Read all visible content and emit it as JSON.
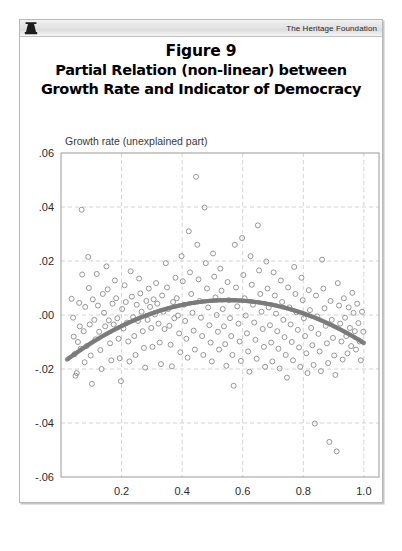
{
  "header": {
    "logo_icon": "liberty-bell-icon",
    "brand": "The Heritage Foundation"
  },
  "title": {
    "line1": "Figure 9",
    "line2": "Partial Relation (non-linear) between",
    "line3": "Growth Rate and Indicator of Democracy"
  },
  "colors": {
    "marker_stroke": "#8c8c8c",
    "curve": "#7a7a7a",
    "gridline": "#c9c9c9",
    "plot_border": "#9a9a9a",
    "text": "#2b2b2b",
    "frame": "#b9b9b9"
  },
  "chart_data": {
    "type": "scatter",
    "title": "Partial Relation (non-linear) between Growth Rate and Indicator of Democracy",
    "xlabel": "Democracy indicator",
    "ylabel": "Growth rate (unexplained part)",
    "xlim": [
      0.0,
      1.05
    ],
    "ylim": [
      -0.06,
      0.06
    ],
    "xticks": [
      0.2,
      0.4,
      0.6,
      0.8,
      1.0
    ],
    "xtick_labels": [
      "0.2",
      "0.4",
      "0.6",
      "0.8",
      "1.0"
    ],
    "yticks": [
      0.06,
      0.04,
      0.02,
      0.0,
      -0.02,
      -0.04,
      -0.06
    ],
    "ytick_labels": [
      ".06",
      ".04",
      ".02",
      ".00",
      "-.02",
      "-.04",
      "-.06"
    ],
    "grid": true,
    "grid_style": "dashed",
    "legend": null,
    "marker": "open-circle",
    "series": [
      {
        "name": "Countries",
        "marker": "open-circle",
        "points": [
          [
            0.035,
            0.006
          ],
          [
            0.04,
            -0.001
          ],
          [
            0.042,
            -0.008
          ],
          [
            0.045,
            -0.0145
          ],
          [
            0.048,
            -0.0225
          ],
          [
            0.052,
            -0.0215
          ],
          [
            0.056,
            -0.01
          ],
          [
            0.06,
            0.0045
          ],
          [
            0.062,
            -0.0042
          ],
          [
            0.065,
            -0.0125
          ],
          [
            0.068,
            0.039
          ],
          [
            0.07,
            0.015
          ],
          [
            0.075,
            -0.006
          ],
          [
            0.078,
            -0.0175
          ],
          [
            0.08,
            0.003
          ],
          [
            0.085,
            -0.0115
          ],
          [
            0.09,
            0.0215
          ],
          [
            0.092,
            0.01
          ],
          [
            0.095,
            -0.0035
          ],
          [
            0.098,
            -0.015
          ],
          [
            0.102,
            -0.0255
          ],
          [
            0.105,
            0.0058
          ],
          [
            0.11,
            -0.0018
          ],
          [
            0.114,
            -0.009
          ],
          [
            0.118,
            0.0152
          ],
          [
            0.122,
            0.0035
          ],
          [
            0.126,
            -0.0062
          ],
          [
            0.13,
            -0.013
          ],
          [
            0.134,
            -0.02
          ],
          [
            0.138,
            0.0078
          ],
          [
            0.142,
            0.0008
          ],
          [
            0.146,
            -0.0042
          ],
          [
            0.15,
            0.018
          ],
          [
            0.154,
            0.0095
          ],
          [
            0.158,
            -0.002
          ],
          [
            0.162,
            -0.0105
          ],
          [
            0.166,
            -0.0168
          ],
          [
            0.17,
            0.0042
          ],
          [
            0.174,
            -0.0035
          ],
          [
            0.178,
            0.0128
          ],
          [
            0.182,
            0.0062
          ],
          [
            0.186,
            -0.0012
          ],
          [
            0.19,
            -0.0088
          ],
          [
            0.194,
            -0.016
          ],
          [
            0.198,
            -0.0245
          ],
          [
            0.202,
            0.0022
          ],
          [
            0.206,
            -0.005
          ],
          [
            0.21,
            0.011
          ],
          [
            0.214,
            0.0048
          ],
          [
            0.218,
            -0.0028
          ],
          [
            0.222,
            -0.0098
          ],
          [
            0.226,
            -0.0172
          ],
          [
            0.23,
            0.0162
          ],
          [
            0.234,
            0.0068
          ],
          [
            0.238,
            -0.0008
          ],
          [
            0.242,
            -0.0078
          ],
          [
            0.246,
            -0.0148
          ],
          [
            0.25,
            0.0038
          ],
          [
            0.254,
            -0.0022
          ],
          [
            0.258,
            0.0135
          ],
          [
            0.262,
            0.008
          ],
          [
            0.266,
            0.0012
          ],
          [
            0.27,
            -0.006
          ],
          [
            0.274,
            -0.0122
          ],
          [
            0.278,
            -0.0195
          ],
          [
            0.282,
            0.0052
          ],
          [
            0.286,
            -0.0018
          ],
          [
            0.29,
            0.0098
          ],
          [
            0.294,
            0.003
          ],
          [
            0.298,
            -0.0048
          ],
          [
            0.302,
            -0.0118
          ],
          [
            0.306,
            0.0058
          ],
          [
            0.31,
            0.0002
          ],
          [
            0.314,
            0.0118
          ],
          [
            0.318,
            0.0042
          ],
          [
            0.322,
            -0.0032
          ],
          [
            0.326,
            -0.0102
          ],
          [
            0.33,
            -0.0182
          ],
          [
            0.334,
            0.0072
          ],
          [
            0.338,
            0.0012
          ],
          [
            0.342,
            -0.0052
          ],
          [
            0.346,
            0.0192
          ],
          [
            0.35,
            0.0102
          ],
          [
            0.354,
            0.0022
          ],
          [
            0.358,
            -0.004
          ],
          [
            0.362,
            -0.011
          ],
          [
            0.366,
            -0.019
          ],
          [
            0.37,
            0.0048
          ],
          [
            0.374,
            -0.0012
          ],
          [
            0.378,
            0.0138
          ],
          [
            0.382,
            0.0062
          ],
          [
            0.386,
            -0.0002
          ],
          [
            0.39,
            -0.0068
          ],
          [
            0.394,
            -0.0138
          ],
          [
            0.398,
            0.0218
          ],
          [
            0.402,
            0.0125
          ],
          [
            0.406,
            0.0038
          ],
          [
            0.41,
            -0.0022
          ],
          [
            0.414,
            -0.0088
          ],
          [
            0.418,
            -0.0158
          ],
          [
            0.422,
            0.031
          ],
          [
            0.426,
            0.0158
          ],
          [
            0.43,
            0.0078
          ],
          [
            0.434,
            0.0008
          ],
          [
            0.438,
            -0.0058
          ],
          [
            0.442,
            -0.0128
          ],
          [
            0.446,
            0.0512
          ],
          [
            0.45,
            0.026
          ],
          [
            0.454,
            0.0132
          ],
          [
            0.458,
            0.0052
          ],
          [
            0.462,
            -0.001
          ],
          [
            0.466,
            -0.0078
          ],
          [
            0.47,
            -0.0148
          ],
          [
            0.474,
            0.0398
          ],
          [
            0.478,
            0.0192
          ],
          [
            0.482,
            0.0098
          ],
          [
            0.486,
            0.0028
          ],
          [
            0.49,
            -0.0038
          ],
          [
            0.494,
            -0.0102
          ],
          [
            0.498,
            -0.0172
          ],
          [
            0.502,
            0.0228
          ],
          [
            0.506,
            0.0142
          ],
          [
            0.51,
            0.0065
          ],
          [
            0.514,
            0.0
          ],
          [
            0.518,
            -0.0062
          ],
          [
            0.522,
            -0.0128
          ],
          [
            0.526,
            0.0172
          ],
          [
            0.53,
            0.009
          ],
          [
            0.534,
            0.0022
          ],
          [
            0.538,
            -0.0042
          ],
          [
            0.542,
            -0.0108
          ],
          [
            0.546,
            -0.0188
          ],
          [
            0.55,
            0.0122
          ],
          [
            0.554,
            0.0055
          ],
          [
            0.558,
            -0.0012
          ],
          [
            0.562,
            -0.0078
          ],
          [
            0.566,
            -0.0148
          ],
          [
            0.57,
            -0.0262
          ],
          [
            0.574,
            0.026
          ],
          [
            0.578,
            0.0102
          ],
          [
            0.582,
            0.0032
          ],
          [
            0.586,
            -0.0032
          ],
          [
            0.59,
            -0.0098
          ],
          [
            0.594,
            -0.017
          ],
          [
            0.598,
            0.0285
          ],
          [
            0.602,
            0.0148
          ],
          [
            0.606,
            0.0062
          ],
          [
            0.61,
            -0.0002
          ],
          [
            0.614,
            -0.0068
          ],
          [
            0.618,
            -0.0135
          ],
          [
            0.622,
            -0.021
          ],
          [
            0.626,
            0.0218
          ],
          [
            0.63,
            0.0112
          ],
          [
            0.634,
            0.0038
          ],
          [
            0.638,
            -0.0028
          ],
          [
            0.642,
            -0.0092
          ],
          [
            0.646,
            -0.0162
          ],
          [
            0.65,
            0.0332
          ],
          [
            0.654,
            0.0165
          ],
          [
            0.658,
            0.0078
          ],
          [
            0.662,
            0.0012
          ],
          [
            0.666,
            -0.0052
          ],
          [
            0.67,
            -0.0118
          ],
          [
            0.674,
            -0.0192
          ],
          [
            0.678,
            0.0198
          ],
          [
            0.682,
            0.0098
          ],
          [
            0.686,
            0.0028
          ],
          [
            0.69,
            -0.0038
          ],
          [
            0.694,
            -0.0102
          ],
          [
            0.698,
            -0.0172
          ],
          [
            0.702,
            0.0158
          ],
          [
            0.706,
            0.0072
          ],
          [
            0.71,
            0.0005
          ],
          [
            0.714,
            -0.006
          ],
          [
            0.718,
            -0.0125
          ],
          [
            0.722,
            -0.0198
          ],
          [
            0.726,
            0.0128
          ],
          [
            0.73,
            0.0048
          ],
          [
            0.734,
            -0.0018
          ],
          [
            0.738,
            -0.0082
          ],
          [
            0.742,
            -0.0148
          ],
          [
            0.746,
            -0.0232
          ],
          [
            0.75,
            0.0102
          ],
          [
            0.754,
            0.0028
          ],
          [
            0.758,
            -0.0035
          ],
          [
            0.762,
            -0.01
          ],
          [
            0.766,
            -0.0168
          ],
          [
            0.77,
            0.0178
          ],
          [
            0.774,
            0.0078
          ],
          [
            0.778,
            0.001
          ],
          [
            0.782,
            -0.0055
          ],
          [
            0.786,
            -0.012
          ],
          [
            0.79,
            -0.0192
          ],
          [
            0.794,
            0.0138
          ],
          [
            0.798,
            0.0055
          ],
          [
            0.802,
            -0.0012
          ],
          [
            0.806,
            -0.0078
          ],
          [
            0.81,
            -0.0142
          ],
          [
            0.814,
            -0.0215
          ],
          [
            0.818,
            0.0092
          ],
          [
            0.822,
            0.0018
          ],
          [
            0.826,
            -0.0048
          ],
          [
            0.83,
            -0.0112
          ],
          [
            0.834,
            -0.0185
          ],
          [
            0.838,
            -0.0402
          ],
          [
            0.842,
            0.0072
          ],
          [
            0.846,
            -0.0005
          ],
          [
            0.85,
            -0.007
          ],
          [
            0.854,
            -0.0135
          ],
          [
            0.858,
            -0.0208
          ],
          [
            0.862,
            0.0205
          ],
          [
            0.866,
            0.0098
          ],
          [
            0.87,
            0.0025
          ],
          [
            0.874,
            -0.004
          ],
          [
            0.878,
            -0.0105
          ],
          [
            0.882,
            -0.0178
          ],
          [
            0.886,
            -0.047
          ],
          [
            0.89,
            0.0052
          ],
          [
            0.894,
            -0.0018
          ],
          [
            0.898,
            -0.0085
          ],
          [
            0.902,
            -0.015
          ],
          [
            0.906,
            -0.0222
          ],
          [
            0.91,
            -0.0505
          ],
          [
            0.914,
            0.0118
          ],
          [
            0.918,
            0.0035
          ],
          [
            0.922,
            -0.0032
          ],
          [
            0.926,
            -0.0098
          ],
          [
            0.93,
            -0.0165
          ],
          [
            0.934,
            0.0062
          ],
          [
            0.938,
            -0.001
          ],
          [
            0.942,
            -0.0078
          ],
          [
            0.946,
            -0.0142
          ],
          [
            0.95,
            0.0028
          ],
          [
            0.954,
            -0.0048
          ],
          [
            0.958,
            -0.0115
          ],
          [
            0.962,
            0.0082
          ],
          [
            0.966,
            0.0008
          ],
          [
            0.97,
            -0.006
          ],
          [
            0.974,
            -0.0128
          ],
          [
            0.978,
            0.0042
          ],
          [
            0.982,
            -0.003
          ],
          [
            0.986,
            -0.0098
          ],
          [
            0.99,
            -0.0168
          ],
          [
            0.994,
            0.0012
          ],
          [
            0.998,
            -0.0062
          ]
        ]
      }
    ],
    "fit_curve": {
      "name": "Quadratic partial-relation fit",
      "style": "thick-dotted-gray",
      "form": "quadratic",
      "vertex_x": 0.55,
      "vertex_y": 0.0055,
      "endpoints": [
        [
          0.02,
          -0.0165
        ],
        [
          1.0,
          -0.0092
        ]
      ],
      "points": [
        [
          0.02,
          -0.0165
        ],
        [
          0.06,
          -0.0137
        ],
        [
          0.1,
          -0.0111
        ],
        [
          0.14,
          -0.0087
        ],
        [
          0.18,
          -0.0064
        ],
        [
          0.22,
          -0.0043
        ],
        [
          0.26,
          -0.0024
        ],
        [
          0.3,
          -0.0007
        ],
        [
          0.34,
          0.0008
        ],
        [
          0.38,
          0.0022
        ],
        [
          0.42,
          0.0034
        ],
        [
          0.46,
          0.0043
        ],
        [
          0.5,
          0.0051
        ],
        [
          0.54,
          0.0055
        ],
        [
          0.58,
          0.0054
        ],
        [
          0.62,
          0.005
        ],
        [
          0.66,
          0.0043
        ],
        [
          0.7,
          0.0034
        ],
        [
          0.74,
          0.0023
        ],
        [
          0.78,
          0.0009
        ],
        [
          0.82,
          -0.0007
        ],
        [
          0.86,
          -0.0026
        ],
        [
          0.9,
          -0.0047
        ],
        [
          0.94,
          -0.0067
        ],
        [
          0.97,
          -0.0081
        ],
        [
          1.0,
          -0.0092
        ]
      ]
    }
  }
}
